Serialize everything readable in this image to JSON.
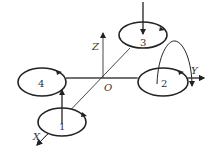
{
  "diagram": {
    "type": "quadrotor-coordinate-frame",
    "axes": {
      "x": "X",
      "y": "Y",
      "z": "Z",
      "origin": "O"
    },
    "rotors": [
      {
        "id": "1",
        "label": "1",
        "thrust_arrow": "up"
      },
      {
        "id": "2",
        "label": "2",
        "thrust_arrow": "curved"
      },
      {
        "id": "3",
        "label": "3",
        "thrust_arrow": "down"
      },
      {
        "id": "4",
        "label": "4",
        "thrust_arrow": "none"
      }
    ],
    "colors": {
      "stroke": "#222222",
      "background": "#ffffff"
    }
  }
}
